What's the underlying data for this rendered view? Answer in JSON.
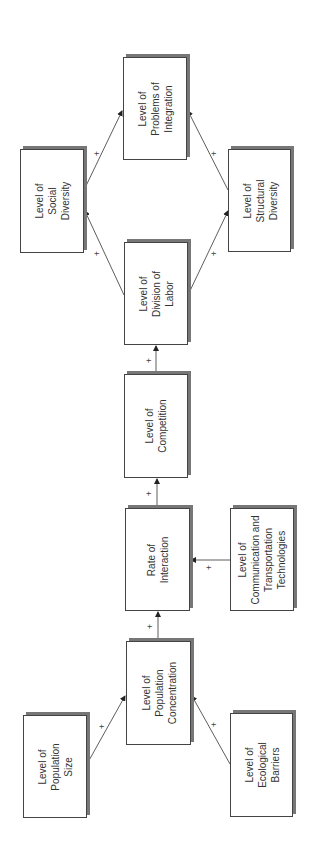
{
  "diagram": {
    "orientation": "rotated-90-ccw",
    "nodes": [
      {
        "id": "population_size",
        "label": "Level of\nPopulation\nSize"
      },
      {
        "id": "ecological_barriers",
        "label": "Level of\nEcological\nBarriers"
      },
      {
        "id": "population_concentration",
        "label": "Level of\nPopulation\nConcentration"
      },
      {
        "id": "rate_of_interaction",
        "label": "Rate of\nInteraction"
      },
      {
        "id": "comm_transport",
        "label": "Level of\nCommunication and\nTransportation\nTechnologies"
      },
      {
        "id": "competition",
        "label": "Level of\nCompetition"
      },
      {
        "id": "division_of_labor",
        "label": "Level of\nDivision of\nLabor"
      },
      {
        "id": "social_diversity",
        "label": "Level of\nSocial\nDiversity"
      },
      {
        "id": "structural_diversity",
        "label": "Level of\nStructural\nDiversity"
      },
      {
        "id": "problems_of_integration",
        "label": "Level of\nProblems of\nIntegration"
      }
    ],
    "edges": [
      {
        "from": "population_size",
        "to": "population_concentration",
        "sign": "+"
      },
      {
        "from": "ecological_barriers",
        "to": "population_concentration",
        "sign": "+"
      },
      {
        "from": "population_concentration",
        "to": "rate_of_interaction",
        "sign": "+"
      },
      {
        "from": "comm_transport",
        "to": "rate_of_interaction",
        "sign": "+"
      },
      {
        "from": "rate_of_interaction",
        "to": "competition",
        "sign": "+"
      },
      {
        "from": "competition",
        "to": "division_of_labor",
        "sign": "+"
      },
      {
        "from": "division_of_labor",
        "to": "social_diversity",
        "sign": "+"
      },
      {
        "from": "division_of_labor",
        "to": "structural_diversity",
        "sign": "+"
      },
      {
        "from": "social_diversity",
        "to": "problems_of_integration",
        "sign": "+"
      },
      {
        "from": "structural_diversity",
        "to": "problems_of_integration",
        "sign": "+"
      }
    ]
  },
  "colors": {
    "box_border": "#444444",
    "box_shadow": "#777777",
    "line": "#333333",
    "text": "#333333"
  }
}
